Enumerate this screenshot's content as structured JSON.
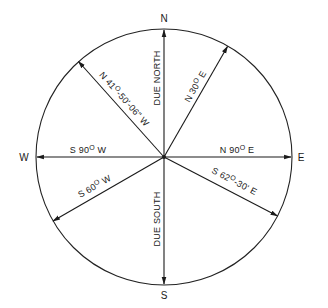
{
  "diagram": {
    "center": {
      "x": 164,
      "y": 157
    },
    "radius": 128,
    "colors": {
      "ink": "#1a1a1a",
      "background": "#ffffff"
    },
    "cardinals": [
      {
        "id": "north",
        "label": "N",
        "x": 164,
        "y": 22
      },
      {
        "id": "east",
        "label": "E",
        "x": 301,
        "y": 161
      },
      {
        "id": "south",
        "label": "S",
        "x": 164,
        "y": 299
      },
      {
        "id": "west",
        "label": "W",
        "x": 24,
        "y": 161
      }
    ],
    "bearings": [
      {
        "id": "due-north",
        "label": "DUE NORTH",
        "azimuth_deg": 0
      },
      {
        "id": "n30e",
        "label": "N 30° E",
        "label_main": "N 30",
        "label_sup": "O",
        "label_tail": " E",
        "azimuth_deg": 30
      },
      {
        "id": "n90e",
        "label": "N 90° E",
        "label_main": "N 90",
        "label_sup": "O",
        "label_tail": " E",
        "azimuth_deg": 90
      },
      {
        "id": "s6230e",
        "label": "S 62°-30' E",
        "label_main": "S 62",
        "label_sup": "O",
        "label_tail": "-30' E",
        "azimuth_deg": 117.5
      },
      {
        "id": "due-south",
        "label": "DUE SOUTH",
        "azimuth_deg": 180
      },
      {
        "id": "s60w",
        "label": "S 60° W",
        "label_main": "S 60",
        "label_sup": "O",
        "label_tail": " W",
        "azimuth_deg": 240
      },
      {
        "id": "s90w",
        "label": "S 90° W",
        "label_main": "S 90",
        "label_sup": "O",
        "label_tail": " W",
        "azimuth_deg": 270
      },
      {
        "id": "n4150w",
        "label": "N 41°-50'-06\" W",
        "label_main": "N 41",
        "label_sup": "O",
        "label_tail": "-50'-06\" W",
        "azimuth_deg": 318.16
      }
    ]
  }
}
